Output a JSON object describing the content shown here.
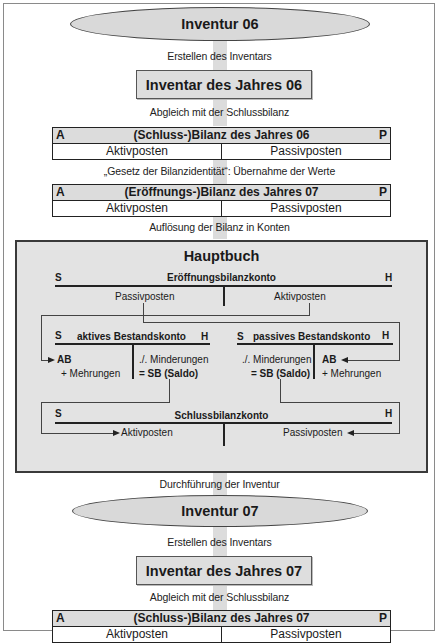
{
  "flow": {
    "inventur_06": "Inventur 06",
    "step_erstellen_1": "Erstellen des Inventars",
    "inventar_06": "Inventar des Jahres 06",
    "step_abgleich_1": "Abgleich mit der Schlussbilanz",
    "bilanz_schluss_06": {
      "left_marker": "A",
      "title": "(Schluss-)Bilanz des Jahres 06",
      "right_marker": "P",
      "left_col": "Aktivposten",
      "right_col": "Passivposten"
    },
    "step_identitaet": "„Gesetz der Bilanzidentität“: Übernahme der Werte",
    "bilanz_eroeffnung_07": {
      "left_marker": "A",
      "title": "(Eröffnungs-)Bilanz des Jahres 07",
      "right_marker": "P",
      "left_col": "Aktivposten",
      "right_col": "Passivposten"
    },
    "step_aufloesung": "Auflösung der Bilanz in Konten",
    "hauptbuch": {
      "title": "Hauptbuch",
      "eroeffnungsbilanzkonto": {
        "left_marker": "S",
        "title": "Eröffnungsbilanzkonto",
        "right_marker": "H",
        "left_entry": "Passivposten",
        "right_entry": "Aktivposten"
      },
      "aktives_bestandskonto": {
        "left_marker": "S",
        "title": "aktives Bestandskonto",
        "right_marker": "H",
        "left_entries": [
          "AB",
          "+ Mehrungen"
        ],
        "right_entries": [
          "./. Minderungen",
          "= SB (Saldo)"
        ]
      },
      "passives_bestandskonto": {
        "left_marker": "S",
        "title": "passives Bestandskonto",
        "right_marker": "H",
        "left_entries": [
          "./. Minderungen",
          "= SB (Saldo)"
        ],
        "right_entries": [
          "AB",
          "+ Mehrungen"
        ]
      },
      "schlussbilanzkonto": {
        "left_marker": "S",
        "title": "Schlussbilanzkonto",
        "right_marker": "H",
        "left_entry": "Aktivposten",
        "right_entry": "Passivposten"
      }
    },
    "step_durchfuehrung": "Durchführung der Inventur",
    "inventur_07": "Inventur 07",
    "step_erstellen_2": "Erstellen des Inventars",
    "inventar_07": "Inventar des Jahres 07",
    "step_abgleich_2": "Abgleich mit der Schlussbilanz",
    "bilanz_schluss_07": {
      "left_marker": "A",
      "title": "(Schluss-)Bilanz des Jahres 07",
      "right_marker": "P",
      "left_col": "Aktivposten",
      "right_col": "Passivposten"
    }
  },
  "colors": {
    "shape_fill": "#d9d9d9",
    "hauptbuch_fill": "#e3e3e3",
    "flow_arrow": "#dcdcdc",
    "line": "#222222",
    "frame": "#8a8a8a"
  }
}
